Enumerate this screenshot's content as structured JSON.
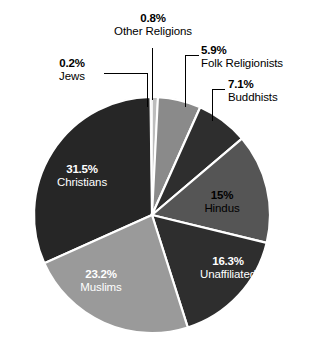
{
  "chart_data": {
    "type": "pie",
    "title": "",
    "categories": [
      "Other Religions",
      "Folk Religionists",
      "Buddhists",
      "Hindus",
      "Unaffiliated",
      "Muslims",
      "Christians",
      "Jews"
    ],
    "values": [
      0.8,
      5.9,
      7.1,
      15,
      16.3,
      23.2,
      31.5,
      0.2
    ],
    "value_labels": [
      "0.8%",
      "5.9%",
      "7.1%",
      "15%",
      "16.3%",
      "23.2%",
      "31.5%",
      "0.2%"
    ],
    "unit": "percent",
    "legend": "none",
    "start_angle_deg": -90,
    "direction": "clockwise",
    "colors": [
      "#bdbdbd",
      "#8a8a8a",
      "#2e2e2e",
      "#555555",
      "#2e2e2e",
      "#9a9a9a",
      "#262626",
      "#3a3a3a"
    ],
    "slice_separator_color": "#ffffff"
  },
  "slices": {
    "other_religions": {
      "pct": "0.8%",
      "name": "Other Religions",
      "color": "#bdbdbd"
    },
    "folk_religionists": {
      "pct": "5.9%",
      "name": "Folk Religionists",
      "color": "#8a8a8a"
    },
    "buddhists": {
      "pct": "7.1%",
      "name": "Buddhists",
      "color": "#2e2e2e"
    },
    "hindus": {
      "pct": "15%",
      "name": "Hindus",
      "color": "#555555"
    },
    "unaffiliated": {
      "pct": "16.3%",
      "name": "Unaffiliated",
      "color": "#2e2e2e"
    },
    "muslims": {
      "pct": "23.2%",
      "name": "Muslims",
      "color": "#9a9a9a"
    },
    "christians": {
      "pct": "31.5%",
      "name": "Christians",
      "color": "#262626"
    },
    "jews": {
      "pct": "0.2%",
      "name": "Jews",
      "color": "#3a3a3a"
    }
  }
}
